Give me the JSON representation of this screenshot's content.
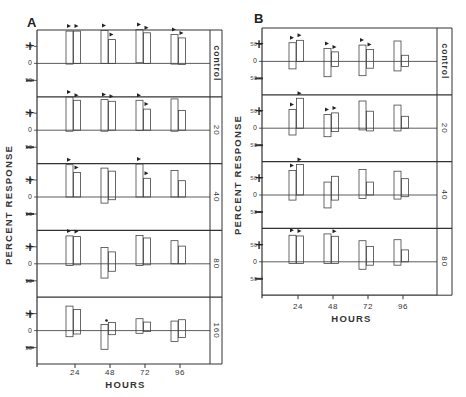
{
  "chart_data": [
    {
      "type": "bar",
      "panel": "A",
      "title": "A",
      "xlabel": "HOURS",
      "ylabel": "PERCENT RESPONSE",
      "x": [
        24,
        48,
        72,
        96
      ],
      "xtick_labels": [
        "24",
        "48",
        "72",
        "96"
      ],
      "ytick_labels": [
        "50",
        "0",
        "50"
      ],
      "sign_labels": {
        "positive": "+",
        "negative": "—"
      },
      "bar_style": "floating range bars (low to high), two per time point, outlined",
      "rows": [
        {
          "label": "control",
          "bars": [
            {
              "x": 24,
              "low": -2,
              "high": 95,
              "marker": true
            },
            {
              "x": 24,
              "low": 0,
              "high": 95,
              "marker": true
            },
            {
              "x": 48,
              "low": 0,
              "high": 97,
              "marker": true
            },
            {
              "x": 48,
              "low": 0,
              "high": 70,
              "marker": true
            },
            {
              "x": 72,
              "low": 2,
              "high": 100,
              "marker": true
            },
            {
              "x": 72,
              "low": 0,
              "high": 90,
              "marker": true
            },
            {
              "x": 96,
              "low": -2,
              "high": 85,
              "marker": true
            },
            {
              "x": 96,
              "low": -3,
              "high": 75,
              "marker": true
            }
          ]
        },
        {
          "label": "20",
          "bars": [
            {
              "x": 24,
              "low": -3,
              "high": 98,
              "marker": true
            },
            {
              "x": 24,
              "low": 0,
              "high": 88,
              "marker": true
            },
            {
              "x": 48,
              "low": -3,
              "high": 90,
              "marker": true
            },
            {
              "x": 48,
              "low": 0,
              "high": 85,
              "marker": true
            },
            {
              "x": 72,
              "low": -1,
              "high": 88,
              "marker": true
            },
            {
              "x": 72,
              "low": 0,
              "high": 62,
              "marker": true
            },
            {
              "x": 96,
              "low": -3,
              "high": 92,
              "marker": false
            },
            {
              "x": 96,
              "low": 0,
              "high": 58,
              "marker": false
            }
          ]
        },
        {
          "label": "40",
          "bars": [
            {
              "x": 24,
              "low": 0,
              "high": 95,
              "marker": true
            },
            {
              "x": 24,
              "low": 0,
              "high": 72,
              "marker": true
            },
            {
              "x": 48,
              "low": -18,
              "high": 85,
              "marker": false
            },
            {
              "x": 48,
              "low": -8,
              "high": 76,
              "marker": false
            },
            {
              "x": 72,
              "low": 0,
              "high": 97,
              "marker": true
            },
            {
              "x": 72,
              "low": 0,
              "high": 55,
              "marker": true
            },
            {
              "x": 96,
              "low": 0,
              "high": 78,
              "marker": false
            },
            {
              "x": 96,
              "low": 0,
              "high": 48,
              "marker": false
            }
          ]
        },
        {
          "label": "80",
          "bars": [
            {
              "x": 24,
              "low": -5,
              "high": 82,
              "marker": true
            },
            {
              "x": 24,
              "low": -3,
              "high": 80,
              "marker": true
            },
            {
              "x": 48,
              "low": -42,
              "high": 48,
              "marker": false
            },
            {
              "x": 48,
              "low": -22,
              "high": 35,
              "marker": false
            },
            {
              "x": 72,
              "low": -5,
              "high": 83,
              "marker": false
            },
            {
              "x": 72,
              "low": -3,
              "high": 76,
              "marker": false
            },
            {
              "x": 96,
              "low": 0,
              "high": 68,
              "marker": false
            },
            {
              "x": 96,
              "low": 0,
              "high": 52,
              "marker": false
            }
          ]
        },
        {
          "label": "160",
          "bars": [
            {
              "x": 24,
              "low": -18,
              "high": 72,
              "marker": false
            },
            {
              "x": 24,
              "low": -10,
              "high": 62,
              "marker": false
            },
            {
              "x": 48,
              "low": -55,
              "high": 18,
              "marker": "asterisk"
            },
            {
              "x": 48,
              "low": -12,
              "high": 24,
              "marker": false
            },
            {
              "x": 72,
              "low": -8,
              "high": 35,
              "marker": false
            },
            {
              "x": 72,
              "low": -3,
              "high": 25,
              "marker": false
            },
            {
              "x": 96,
              "low": -32,
              "high": 28,
              "marker": false
            },
            {
              "x": 96,
              "low": -20,
              "high": 32,
              "marker": false
            }
          ]
        }
      ]
    },
    {
      "type": "bar",
      "panel": "B",
      "title": "B",
      "xlabel": "HOURS",
      "ylabel": "PERCENT RESPONSE",
      "x": [
        24,
        48,
        72,
        96
      ],
      "xtick_labels": [
        "24",
        "48",
        "72",
        "96"
      ],
      "ytick_labels": [
        "50",
        "0",
        "50"
      ],
      "sign_labels": {
        "positive": "+",
        "negative": "—"
      },
      "bar_style": "floating range bars (low to high), two per time point, outlined",
      "rows": [
        {
          "label": "control",
          "bars": [
            {
              "x": 24,
              "low": -22,
              "high": 55,
              "marker": true
            },
            {
              "x": 24,
              "low": 0,
              "high": 62,
              "marker": true
            },
            {
              "x": 48,
              "low": -45,
              "high": 38,
              "marker": true
            },
            {
              "x": 48,
              "low": -15,
              "high": 28,
              "marker": true
            },
            {
              "x": 72,
              "low": -42,
              "high": 48,
              "marker": true
            },
            {
              "x": 72,
              "low": -20,
              "high": 35,
              "marker": true
            },
            {
              "x": 96,
              "low": -28,
              "high": 60,
              "marker": false
            },
            {
              "x": 96,
              "low": -15,
              "high": 18,
              "marker": false
            }
          ]
        },
        {
          "label": "20",
          "bars": [
            {
              "x": 24,
              "low": -20,
              "high": 55,
              "marker": true
            },
            {
              "x": 24,
              "low": 0,
              "high": 88,
              "marker": true
            },
            {
              "x": 48,
              "low": -25,
              "high": 40,
              "marker": true
            },
            {
              "x": 48,
              "low": -10,
              "high": 45,
              "marker": true
            },
            {
              "x": 72,
              "low": -5,
              "high": 80,
              "marker": false
            },
            {
              "x": 72,
              "low": -8,
              "high": 50,
              "marker": false
            },
            {
              "x": 96,
              "low": -8,
              "high": 68,
              "marker": false
            },
            {
              "x": 96,
              "low": 0,
              "high": 35,
              "marker": false
            }
          ]
        },
        {
          "label": "40",
          "bars": [
            {
              "x": 24,
              "low": -15,
              "high": 72,
              "marker": true
            },
            {
              "x": 24,
              "low": 0,
              "high": 90,
              "marker": true
            },
            {
              "x": 48,
              "low": -38,
              "high": 38,
              "marker": false
            },
            {
              "x": 48,
              "low": -15,
              "high": 55,
              "marker": false
            },
            {
              "x": 72,
              "low": -10,
              "high": 75,
              "marker": false
            },
            {
              "x": 72,
              "low": 0,
              "high": 38,
              "marker": false
            },
            {
              "x": 96,
              "low": -12,
              "high": 70,
              "marker": false
            },
            {
              "x": 96,
              "low": -5,
              "high": 48,
              "marker": false
            }
          ]
        },
        {
          "label": "80",
          "bars": [
            {
              "x": 24,
              "low": -5,
              "high": 78,
              "marker": true
            },
            {
              "x": 24,
              "low": -5,
              "high": 76,
              "marker": true
            },
            {
              "x": 48,
              "low": -5,
              "high": 82,
              "marker": false
            },
            {
              "x": 48,
              "low": -5,
              "high": 75,
              "marker": true
            },
            {
              "x": 72,
              "low": -22,
              "high": 62,
              "marker": false
            },
            {
              "x": 72,
              "low": -10,
              "high": 45,
              "marker": false
            },
            {
              "x": 96,
              "low": -10,
              "high": 65,
              "marker": false
            },
            {
              "x": 96,
              "low": 0,
              "high": 35,
              "marker": false
            }
          ]
        }
      ]
    }
  ]
}
